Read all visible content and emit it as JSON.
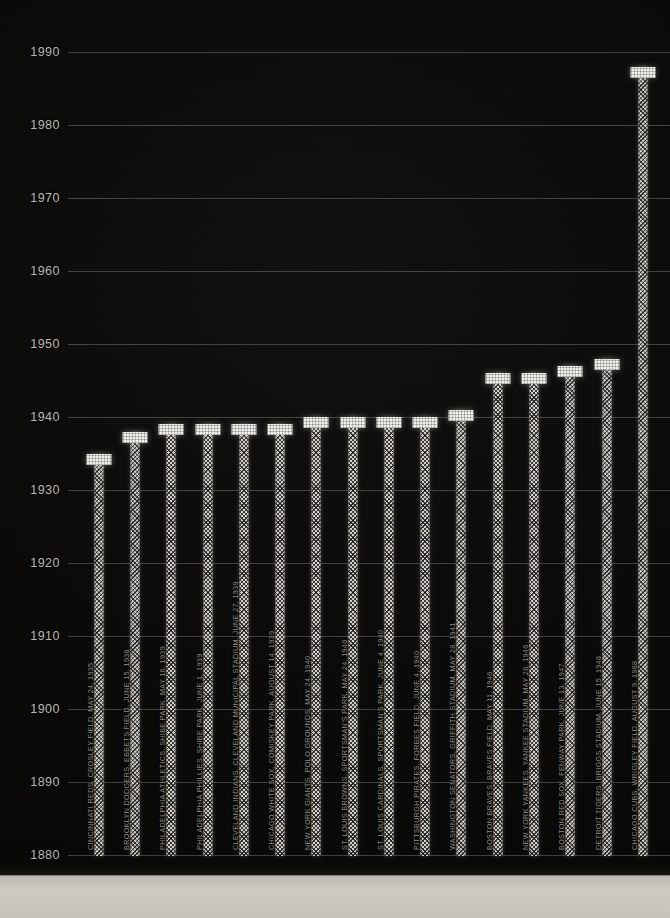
{
  "chart_data": {
    "type": "bar",
    "title": "",
    "xlabel": "",
    "ylabel": "",
    "ylim": [
      1875,
      1995
    ],
    "yticks": [
      1880,
      1890,
      1900,
      1910,
      1920,
      1930,
      1940,
      1950,
      1960,
      1970,
      1980,
      1990
    ],
    "grid": true,
    "legend": "none",
    "orientation": "vertical",
    "categories": [
      "CINCINNATI REDS, CROSLEY FIELD, MAY 24, 1935",
      "BROOKLYN DODGERS, EBBETS FIELD, JUNE 15, 1938",
      "PHILADELPHIA ATHLETICS, SHIBE PARK, MAY 16, 1939",
      "PHILADELPHIA PHILLIES, SHIBE PARK, JUNE 1, 1939",
      "CLEVELAND INDIANS, CLEVELAND MUNICIPAL STADIUM, JUNE 27, 1939",
      "CHICAGO WHITE SOX, COMISKEY PARK, AUGUST 14, 1939",
      "NEW YORK GIANTS, POLO GROUNDS, MAY 24, 1940",
      "ST. LOUIS BROWNS, SPORTSMAN'S PARK, MAY 24, 1940",
      "ST. LOUIS CARDINALS, SPORTSMAN'S PARK, JUNE 4, 1940",
      "PITTSBURGH PIRATES, FORBES FIELD, JUNE 4, 1940",
      "WASHINGTON SENATORS, GRIFFITH STADIUM, MAY 28, 1941",
      "BOSTON BRAVES, BRAVES FIELD, MAY 11, 1946",
      "NEW YORK YANKEES, YANKEE STADIUM, MAY 28, 1946",
      "BOSTON RED SOX, FENWAY PARK, JUNE 13, 1947",
      "DETROIT TIGERS, BRIGGS STADIUM, JUNE 15, 1948",
      "CHICAGO CUBS, WRIGLEY FIELD, AUGUST 9, 1988"
    ],
    "values": [
      1935,
      1938,
      1939,
      1939,
      1939,
      1939,
      1940,
      1940,
      1940,
      1940,
      1941,
      1946,
      1946,
      1947,
      1948,
      1988
    ],
    "teams": [
      "CINCINNATI REDS",
      "BROOKLYN DODGERS",
      "PHILADELPHIA ATHLETICS",
      "PHILADELPHIA PHILLIES",
      "CLEVELAND INDIANS",
      "CHICAGO WHITE SOX",
      "NEW YORK GIANTS",
      "ST. LOUIS BROWNS",
      "ST. LOUIS CARDINALS",
      "PITTSBURGH PIRATES",
      "WASHINGTON SENATORS",
      "BOSTON BRAVES",
      "NEW YORK YANKEES",
      "BOSTON RED SOX",
      "DETROIT TIGERS",
      "CHICAGO CUBS"
    ],
    "ballparks": [
      "CROSLEY FIELD",
      "EBBETS FIELD",
      "SHIBE PARK",
      "SHIBE PARK",
      "CLEVELAND MUNICIPAL STADIUM",
      "COMISKEY PARK",
      "POLO GROUNDS",
      "SPORTSMAN'S PARK",
      "SPORTSMAN'S PARK",
      "FORBES FIELD",
      "GRIFFITH STADIUM",
      "BRAVES FIELD",
      "YANKEE STADIUM",
      "FENWAY PARK",
      "BRIGGS STADIUM",
      "WRIGLEY FIELD"
    ],
    "dates": [
      "MAY 24, 1935",
      "JUNE 15, 1938",
      "MAY 16, 1939",
      "JUNE 1, 1939",
      "JUNE 27, 1939",
      "AUGUST 14, 1939",
      "MAY 24, 1940",
      "MAY 24, 1940",
      "JUNE 4, 1940",
      "JUNE 4, 1940",
      "MAY 28, 1941",
      "MAY 11, 1946",
      "MAY 28, 1946",
      "JUNE 13, 1947",
      "JUNE 15, 1948",
      "AUGUST 9, 1988"
    ]
  },
  "colors": {
    "background": "#080808",
    "bar_cap": "#f2f0ea",
    "bar_stem": "#cfcdc6",
    "grid": "#bebeb9",
    "tick_text": "#b9b6ae",
    "bar_label_text": "#8e8b83",
    "base_platform": "#c4c2bb"
  }
}
